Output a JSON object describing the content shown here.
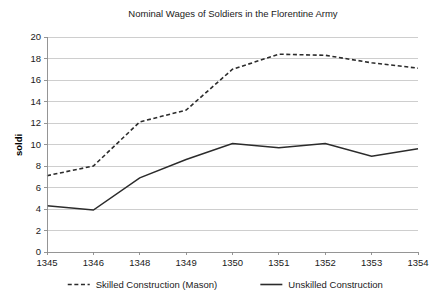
{
  "chart_data": {
    "type": "line",
    "title": "Nominal Wages of Soldiers in the Florentine Army",
    "xlabel": "",
    "ylabel": "soldi",
    "categories": [
      "1345",
      "1346",
      "1348",
      "1349",
      "1350",
      "1351",
      "1352",
      "1353",
      "1354"
    ],
    "series": [
      {
        "name": "Skilled Construction (Mason)",
        "style": "dashed",
        "color": "#2b2b2b",
        "values": [
          7.1,
          8.0,
          12.1,
          13.2,
          17.0,
          18.4,
          18.3,
          17.6,
          17.1
        ]
      },
      {
        "name": "Unskilled Construction",
        "style": "solid",
        "color": "#2b2b2b",
        "values": [
          4.3,
          3.9,
          6.9,
          8.6,
          10.1,
          9.7,
          10.1,
          8.9,
          9.6
        ]
      }
    ],
    "ylim": [
      0,
      20
    ],
    "ytick_step": 2,
    "yticks": [
      "0",
      "2",
      "4",
      "6",
      "8",
      "10",
      "12",
      "14",
      "16",
      "18",
      "20"
    ],
    "grid": true,
    "legend_position": "bottom"
  }
}
